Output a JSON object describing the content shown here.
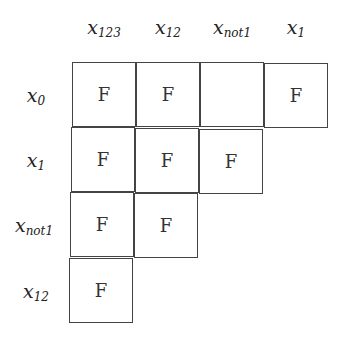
{
  "columns": [
    {
      "base": "x",
      "sub": "123"
    },
    {
      "base": "x",
      "sub": "12"
    },
    {
      "base": "x",
      "sub": "not1"
    },
    {
      "base": "x",
      "sub": "1"
    }
  ],
  "rows": [
    {
      "base": "x",
      "sub": "0",
      "cells": [
        "F",
        "F",
        "",
        "F"
      ]
    },
    {
      "base": "x",
      "sub": "1",
      "cells": [
        "F",
        "F",
        "F"
      ]
    },
    {
      "base": "x",
      "sub": "not1",
      "cells": [
        "F",
        "F"
      ]
    },
    {
      "base": "x",
      "sub": "12",
      "cells": [
        "F"
      ]
    }
  ]
}
